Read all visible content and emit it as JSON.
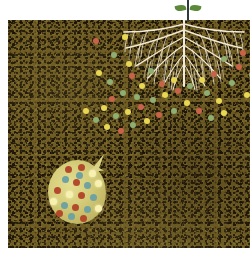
{
  "illustration": {
    "title": "Soil cross-section with potato tuber, plant root system and nutrient particles",
    "caption": "",
    "width": 250,
    "height": 258
  },
  "colors": {
    "soil_base": "#6e5c23",
    "soil_dark_speck": "#1a1307",
    "soil_light_speck": "#9e8c4a",
    "sky": "#ffffff",
    "root": "#f2ead2",
    "stem": "#2f3a3f",
    "leaf": "#5d8a3a",
    "tuber_body": "#d7cf7c",
    "dot_red": "#b34a2c",
    "dot_teal": "#6fa2a0",
    "dot_pale_yellow": "#f7f0b0",
    "particle_yellow": "#e8d753",
    "particle_green": "#8fae71",
    "particle_red": "#c8634a"
  },
  "scene": {
    "sky_band_label": "air above soil",
    "soil_label": "soil",
    "soil_top_y": 20,
    "soil_bottom_y": 248
  },
  "seedling": {
    "label": "seedling shoot",
    "stem_label": "stem",
    "leaves": [
      {
        "label": "left leaf"
      },
      {
        "label": "right leaf"
      }
    ]
  },
  "root_system": {
    "label": "fibrous root system",
    "description": "branching taproot with fine lateral roots spreading through soil"
  },
  "tuber": {
    "label": "potato tuber",
    "bud_label": "sprout bud",
    "dots": [
      {
        "color": "red",
        "x": 30,
        "y": 4
      },
      {
        "color": "pale",
        "x": 41,
        "y": 10
      },
      {
        "color": "teal",
        "x": 14,
        "y": 16
      },
      {
        "color": "red",
        "x": 25,
        "y": 19
      },
      {
        "color": "teal",
        "x": 36,
        "y": 22
      },
      {
        "color": "pale",
        "x": 47,
        "y": 20
      },
      {
        "color": "red",
        "x": 6,
        "y": 27
      },
      {
        "color": "pale",
        "x": 18,
        "y": 31
      },
      {
        "color": "red",
        "x": 30,
        "y": 32
      },
      {
        "color": "teal",
        "x": 42,
        "y": 34
      },
      {
        "color": "pale",
        "x": 2,
        "y": 38
      },
      {
        "color": "teal",
        "x": 13,
        "y": 42
      },
      {
        "color": "red",
        "x": 24,
        "y": 44
      },
      {
        "color": "teal",
        "x": 36,
        "y": 46
      },
      {
        "color": "pale",
        "x": 47,
        "y": 45
      },
      {
        "color": "red",
        "x": 8,
        "y": 50
      },
      {
        "color": "teal",
        "x": 20,
        "y": 53
      },
      {
        "color": "red",
        "x": 32,
        "y": 55
      },
      {
        "color": "teal",
        "x": 28,
        "y": 12
      },
      {
        "color": "red",
        "x": 17,
        "y": 6
      }
    ]
  },
  "particles": {
    "label": "nutrient particles in soil",
    "legend": [
      {
        "color_name": "yellow",
        "hex": "#e8d753"
      },
      {
        "color_name": "green",
        "hex": "#8fae71"
      },
      {
        "color_name": "red",
        "hex": "#c8634a"
      }
    ],
    "items": [
      {
        "color": "red",
        "x": 85,
        "y": 18
      },
      {
        "color": "yellow",
        "x": 114,
        "y": 14
      },
      {
        "color": "green",
        "x": 103,
        "y": 32
      },
      {
        "color": "yellow",
        "x": 118,
        "y": 41
      },
      {
        "color": "yellow",
        "x": 88,
        "y": 50
      },
      {
        "color": "green",
        "x": 99,
        "y": 59
      },
      {
        "color": "red",
        "x": 121,
        "y": 53
      },
      {
        "color": "green",
        "x": 140,
        "y": 48
      },
      {
        "color": "yellow",
        "x": 131,
        "y": 63
      },
      {
        "color": "green",
        "x": 126,
        "y": 74
      },
      {
        "color": "red",
        "x": 151,
        "y": 61
      },
      {
        "color": "yellow",
        "x": 163,
        "y": 57
      },
      {
        "color": "green",
        "x": 112,
        "y": 70
      },
      {
        "color": "red",
        "x": 101,
        "y": 76
      },
      {
        "color": "yellow",
        "x": 93,
        "y": 85
      },
      {
        "color": "green",
        "x": 105,
        "y": 93
      },
      {
        "color": "yellow",
        "x": 117,
        "y": 89
      },
      {
        "color": "red",
        "x": 130,
        "y": 84
      },
      {
        "color": "green",
        "x": 142,
        "y": 77
      },
      {
        "color": "yellow",
        "x": 154,
        "y": 72
      },
      {
        "color": "red",
        "x": 167,
        "y": 68
      },
      {
        "color": "green",
        "x": 179,
        "y": 63
      },
      {
        "color": "yellow",
        "x": 191,
        "y": 57
      },
      {
        "color": "red",
        "x": 203,
        "y": 51
      },
      {
        "color": "green",
        "x": 196,
        "y": 70
      },
      {
        "color": "yellow",
        "x": 208,
        "y": 78
      },
      {
        "color": "green",
        "x": 221,
        "y": 60
      },
      {
        "color": "red",
        "x": 228,
        "y": 44
      },
      {
        "color": "yellow",
        "x": 236,
        "y": 72
      },
      {
        "color": "green",
        "x": 213,
        "y": 36
      },
      {
        "color": "red",
        "x": 232,
        "y": 30
      },
      {
        "color": "yellow",
        "x": 176,
        "y": 80
      },
      {
        "color": "green",
        "x": 163,
        "y": 88
      },
      {
        "color": "red",
        "x": 148,
        "y": 92
      },
      {
        "color": "yellow",
        "x": 136,
        "y": 98
      },
      {
        "color": "green",
        "x": 122,
        "y": 102
      },
      {
        "color": "red",
        "x": 110,
        "y": 108
      },
      {
        "color": "yellow",
        "x": 96,
        "y": 104
      },
      {
        "color": "green",
        "x": 85,
        "y": 97
      },
      {
        "color": "yellow",
        "x": 75,
        "y": 88
      },
      {
        "color": "red",
        "x": 188,
        "y": 88
      },
      {
        "color": "green",
        "x": 200,
        "y": 95
      },
      {
        "color": "yellow",
        "x": 213,
        "y": 90
      },
      {
        "color": "green",
        "x": 241,
        "y": 52
      },
      {
        "color": "red",
        "x": 244,
        "y": 88
      }
    ]
  }
}
